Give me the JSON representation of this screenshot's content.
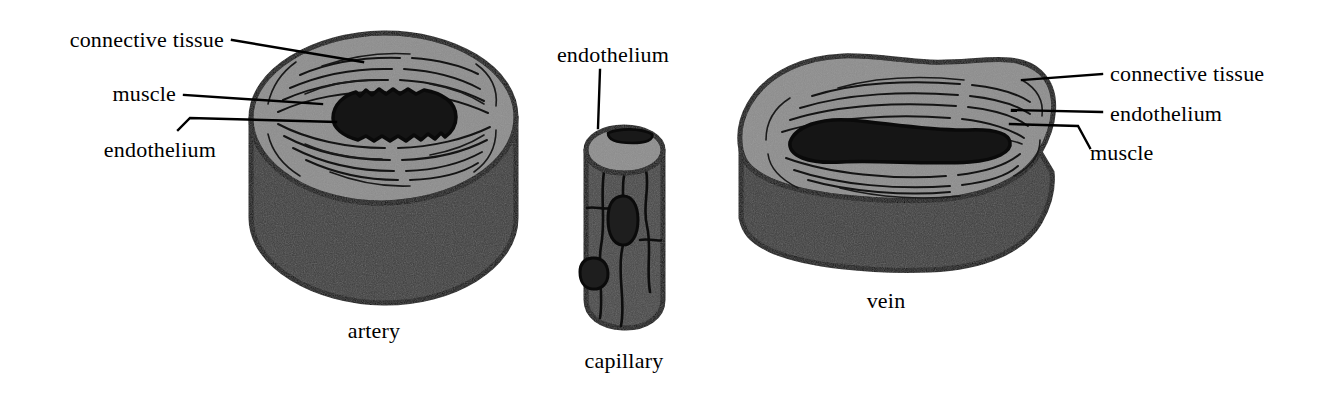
{
  "figure": {
    "background_color": "#ffffff"
  },
  "palette": {
    "outline": "#0a0a0a",
    "top_face_light_gray": "#8d8d8d",
    "side_wall_dark_gray": "#3d3d3d",
    "lumen_black": "#151515",
    "text_black": "#000000"
  },
  "vessels": [
    {
      "id": "artery",
      "caption": "artery",
      "labels": [
        {
          "key": "connective_tissue",
          "text": "connective tissue"
        },
        {
          "key": "muscle",
          "text": "muscle"
        },
        {
          "key": "endothelium",
          "text": "endothelium"
        }
      ]
    },
    {
      "id": "capillary",
      "caption": "capillary",
      "labels": [
        {
          "key": "endothelium",
          "text": "endothelium"
        }
      ]
    },
    {
      "id": "vein",
      "caption": "vein",
      "labels": [
        {
          "key": "connective_tissue",
          "text": "connective tissue"
        },
        {
          "key": "endothelium",
          "text": "endothelium"
        },
        {
          "key": "muscle",
          "text": "muscle"
        }
      ]
    }
  ],
  "labels": {
    "artery_connective_tissue": "connective tissue",
    "artery_muscle": "muscle",
    "artery_endothelium": "endothelium",
    "capillary_endothelium": "endothelium",
    "vein_connective_tissue": "connective tissue",
    "vein_endothelium": "endothelium",
    "vein_muscle": "muscle"
  },
  "captions": {
    "artery": "artery",
    "capillary": "capillary",
    "vein": "vein"
  }
}
